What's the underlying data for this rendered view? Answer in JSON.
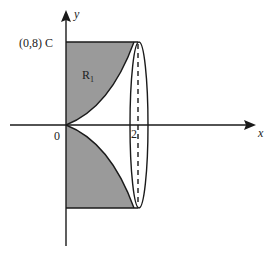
{
  "diagram": {
    "axes": {
      "x_label": "x",
      "y_label": "y",
      "origin_label": "0",
      "x_tick_label": "2"
    },
    "points": {
      "C_label": "(0,8) C"
    },
    "regions": {
      "R1_label": "R",
      "R1_subscript": "1"
    },
    "colors": {
      "shade": "#9a9a9a",
      "line": "#1a1a1a",
      "background": "#ffffff"
    }
  }
}
